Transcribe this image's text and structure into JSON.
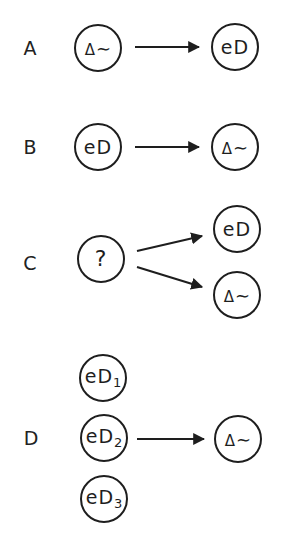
{
  "rows": [
    {
      "label": "A",
      "nodes": [
        {
          "id": "a-src",
          "text": "Δ∼",
          "kind": "delta-wave",
          "sub": ""
        },
        {
          "id": "a-dst",
          "text": "eD",
          "kind": "eD",
          "sub": ""
        }
      ],
      "arrows": [
        {
          "from": "a-src",
          "to": "a-dst"
        }
      ]
    },
    {
      "label": "B",
      "nodes": [
        {
          "id": "b-src",
          "text": "eD",
          "kind": "eD",
          "sub": ""
        },
        {
          "id": "b-dst",
          "text": "Δ∼",
          "kind": "delta-wave",
          "sub": ""
        }
      ],
      "arrows": [
        {
          "from": "b-src",
          "to": "b-dst"
        }
      ]
    },
    {
      "label": "C",
      "nodes": [
        {
          "id": "c-src",
          "text": "?",
          "kind": "unknown",
          "sub": ""
        },
        {
          "id": "c-dst-1",
          "text": "eD",
          "kind": "eD",
          "sub": ""
        },
        {
          "id": "c-dst-2",
          "text": "Δ∼",
          "kind": "delta-wave",
          "sub": ""
        }
      ],
      "arrows": [
        {
          "from": "c-src",
          "to": "c-dst-1"
        },
        {
          "from": "c-src",
          "to": "c-dst-2"
        }
      ]
    },
    {
      "label": "D",
      "nodes": [
        {
          "id": "d-src-1",
          "text": "eD",
          "kind": "eD",
          "sub": "1"
        },
        {
          "id": "d-src-2",
          "text": "eD",
          "kind": "eD",
          "sub": "2"
        },
        {
          "id": "d-src-3",
          "text": "eD",
          "kind": "eD",
          "sub": "3"
        },
        {
          "id": "d-dst",
          "text": "Δ∼",
          "kind": "delta-wave",
          "sub": ""
        }
      ],
      "arrows": [
        {
          "from": "d-src-2",
          "to": "d-dst"
        }
      ]
    }
  ],
  "symbols": {
    "delta": "Δ",
    "wave": "∼",
    "unknown": "?",
    "eD": "eD"
  },
  "colors": {
    "stroke": "#1e1e1e",
    "background": "#ffffff"
  }
}
